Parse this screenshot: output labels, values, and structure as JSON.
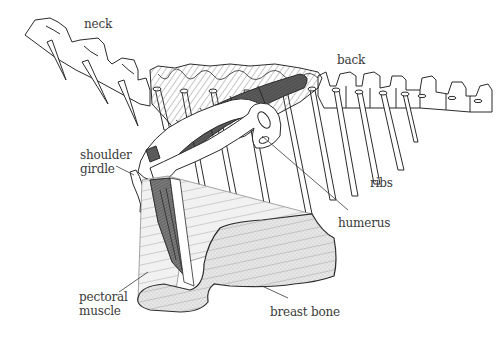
{
  "diagram": {
    "colors": {
      "background": "#ffffff",
      "outline": "#2b2b2b",
      "label_text": "#3a3a3a",
      "hatch_light": "#9a9a9a",
      "muscle_dark": "#6e6e6e",
      "pectoral_fill": "#ececec",
      "breastbone_fill": "#e4e4e4"
    },
    "labels": [
      {
        "id": "neck",
        "text": "neck",
        "x": 84,
        "y": 17
      },
      {
        "id": "back",
        "text": "back",
        "x": 337,
        "y": 53
      },
      {
        "id": "shoulder-girdle",
        "text": "shoulder\ngirdle",
        "x": 80,
        "y": 148
      },
      {
        "id": "ribs",
        "text": "ribs",
        "x": 370,
        "y": 176
      },
      {
        "id": "humerus",
        "text": "humerus",
        "x": 338,
        "y": 216
      },
      {
        "id": "pectoral-muscle",
        "text": "pectoral\nmuscle",
        "x": 79,
        "y": 290
      },
      {
        "id": "breast-bone",
        "text": "breast bone",
        "x": 270,
        "y": 305
      }
    ]
  }
}
